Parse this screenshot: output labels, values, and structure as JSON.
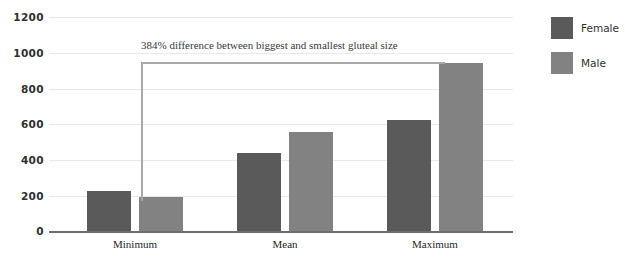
{
  "chart_data": {
    "type": "bar",
    "title": "",
    "subtitle": "",
    "xlabel": "",
    "ylabel": "",
    "categories": [
      "Minimum",
      "Mean",
      "Maximum"
    ],
    "series": [
      {
        "name": "Female",
        "color": "#5a5a5a",
        "values": [
          225,
          440,
          625
        ]
      },
      {
        "name": "Male",
        "color": "#828282",
        "values": [
          190,
          555,
          940
        ]
      }
    ],
    "ylim": [
      0,
      1200
    ],
    "yticks": [
      0,
      200,
      400,
      600,
      800,
      1000,
      1200
    ],
    "ytick_labels": [
      "0",
      "200",
      "400",
      "600",
      "800",
      "1000",
      "1200"
    ],
    "grid": true,
    "legend_position": "right",
    "annotations": [
      {
        "text": "384% difference between biggest and smallest gluteal size",
        "kind": "bracket",
        "from_category": "Minimum",
        "from_series": "Male",
        "to_category": "Maximum",
        "to_series": "Male"
      }
    ]
  },
  "legend": {
    "items": [
      {
        "label": "Female",
        "color": "#5a5a5a"
      },
      {
        "label": "Male",
        "color": "#828282"
      }
    ]
  },
  "annotation": {
    "text": "384% difference between biggest and smallest gluteal size"
  },
  "axis": {
    "ticks": [
      "1200",
      "1000",
      "800",
      "600",
      "400",
      "200",
      "0"
    ]
  },
  "categories": {
    "minimum": "Minimum",
    "mean": "Mean",
    "maximum": "Maximum"
  }
}
